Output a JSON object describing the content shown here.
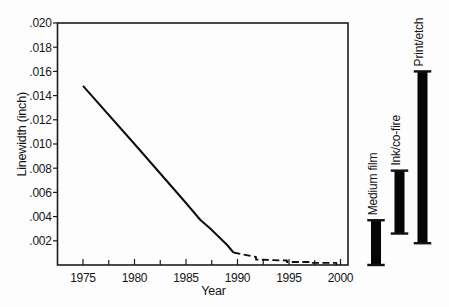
{
  "figure": {
    "background": "#fdfdfd",
    "ink": "#111111"
  },
  "chart_data": {
    "type": "line",
    "title": "",
    "xlabel": "Year",
    "ylabel": "Linewidth (inch)",
    "xlim": [
      1972.5,
      2000.7
    ],
    "ylim": [
      0,
      0.02
    ],
    "grid": false,
    "legend": "none",
    "x_ticks": {
      "major": [
        1975,
        1980,
        1985,
        1990,
        1995,
        2000
      ],
      "labels": [
        "1975",
        "1980",
        "1985",
        "1990",
        "1995",
        "2000"
      ],
      "minor": [
        1977.5,
        1982.5,
        1987.5,
        1992.5,
        1997.5
      ]
    },
    "y_ticks": {
      "values": [
        0.002,
        0.004,
        0.006,
        0.008,
        0.01,
        0.012,
        0.014,
        0.016,
        0.018,
        0.02
      ],
      "labels": [
        ".002",
        ".004",
        ".006",
        ".008",
        ".010",
        ".012",
        ".014",
        ".016",
        ".018",
        ".020"
      ]
    },
    "series": [
      {
        "name": "linewidth-trend-solid",
        "style": "solid",
        "points": [
          [
            1975,
            0.0148
          ],
          [
            1980,
            0.01
          ],
          [
            1985,
            0.00512
          ],
          [
            1986.4,
            0.00372
          ],
          [
            1987.3,
            0.00306
          ],
          [
            1988.3,
            0.00223
          ],
          [
            1989.0,
            0.00165
          ],
          [
            1989.6,
            0.00103
          ]
        ]
      },
      {
        "name": "linewidth-trend-projected-dashed",
        "style": "dashed",
        "points": [
          [
            1989.6,
            0.00103
          ],
          [
            1991.0,
            0.00079
          ],
          [
            1991.8,
            0.00066
          ],
          [
            1991.8,
            0.00045
          ],
          [
            1994.8,
            0.00037
          ],
          [
            1994.8,
            0.00025
          ],
          [
            1997.3,
            0.00025
          ],
          [
            1997.3,
            0.00017
          ],
          [
            1999.6,
            0.00017
          ],
          [
            1999.6,
            0.0
          ]
        ]
      }
    ],
    "technology_range_bars": [
      {
        "label": "Medium film",
        "low": 0.0,
        "high": 0.0037
      },
      {
        "label": "Ink/co-fire",
        "low": 0.0026,
        "high": 0.0078
      },
      {
        "label": "Print/etch",
        "low": 0.0018,
        "high": 0.016
      }
    ]
  }
}
